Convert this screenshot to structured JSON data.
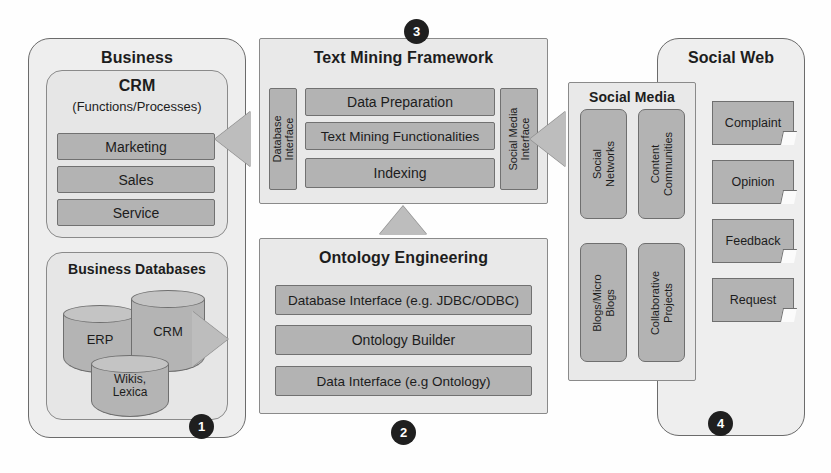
{
  "diagram": {
    "colors": {
      "panel_fill": "#eeeeee",
      "panel_border": "#6b6b6b",
      "bar_fill": "#b3b3b3",
      "bar_border": "#717171",
      "arrow_fill": "#bdbdbd",
      "badge_fill": "#1f1f1f",
      "badge_text": "#ffffff",
      "text": "#1c1c1c",
      "background": "#ffffff"
    }
  },
  "business": {
    "title": "Business",
    "crm": {
      "title": "CRM",
      "subtitle": "(Functions/Processes)",
      "items": [
        {
          "label": "Marketing"
        },
        {
          "label": "Sales"
        },
        {
          "label": "Service"
        }
      ]
    },
    "databases": {
      "title": "Business Databases",
      "cylinders": [
        {
          "label": "ERP"
        },
        {
          "label": "CRM"
        },
        {
          "label_line1": "Wikis,",
          "label_line2": "Lexica"
        }
      ]
    },
    "badge": "1"
  },
  "text_mining": {
    "title": "Text Mining Framework",
    "left_interface": {
      "line1": "Database",
      "line2": "Interface"
    },
    "right_interface": {
      "line1": "Social Media",
      "line2": "Interface"
    },
    "layers": [
      {
        "label": "Data Preparation"
      },
      {
        "label": "Text Mining Functionalities"
      },
      {
        "label": "Indexing"
      }
    ],
    "badge": "3"
  },
  "ontology": {
    "title": "Ontology Engineering",
    "layers": [
      {
        "label": "Database Interface (e.g. JDBC/ODBC)"
      },
      {
        "label": "Ontology Builder"
      },
      {
        "label": "Data Interface (e.g Ontology)"
      }
    ],
    "badge": "2"
  },
  "social_media": {
    "title": "Social Media",
    "items": [
      {
        "line1": "Social",
        "line2": "Networks"
      },
      {
        "line1": "Content",
        "line2": "Communities"
      },
      {
        "line1": "Blogs/Micro",
        "line2": "Blogs"
      },
      {
        "line1": "Collaborative",
        "line2": "Projects"
      }
    ]
  },
  "social_web": {
    "title": "Social Web",
    "items": [
      {
        "label": "Complaint"
      },
      {
        "label": "Opinion"
      },
      {
        "label": "Feedback"
      },
      {
        "label": "Request"
      }
    ],
    "badge": "4"
  },
  "arrows": [
    {
      "name": "framework-to-crm",
      "direction": "left"
    },
    {
      "name": "databases-to-ontology",
      "direction": "right"
    },
    {
      "name": "ontology-to-framework",
      "direction": "up"
    },
    {
      "name": "social-media-to-framework",
      "direction": "left"
    }
  ]
}
